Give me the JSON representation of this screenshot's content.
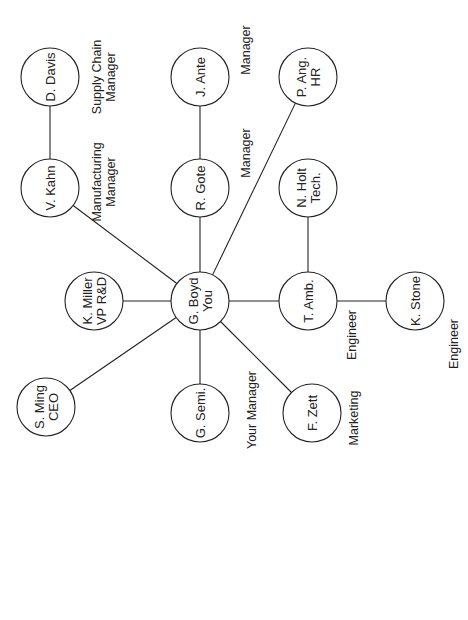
{
  "diagram": {
    "nodes": [
      {
        "id": "davis",
        "line1": "D. Davis",
        "line2": "",
        "cx": 50,
        "cy": 77
      },
      {
        "id": "kahn",
        "line1": "V. Kahn",
        "line2": "",
        "cx": 50,
        "cy": 188
      },
      {
        "id": "ante",
        "line1": "J. Ante",
        "line2": "",
        "cx": 200,
        "cy": 77
      },
      {
        "id": "gote",
        "line1": "R. Gote",
        "line2": "",
        "cx": 200,
        "cy": 188
      },
      {
        "id": "ang",
        "line1": "P. Ang.",
        "line2": "HR",
        "cx": 308,
        "cy": 77
      },
      {
        "id": "holt",
        "line1": "N. Holt",
        "line2": "Tech.",
        "cx": 308,
        "cy": 188
      },
      {
        "id": "miller",
        "line1": "K. Miller",
        "line2": "VP R&D",
        "cx": 94,
        "cy": 301
      },
      {
        "id": "boyd",
        "line1": "G. Boyd",
        "line2": "You",
        "cx": 200,
        "cy": 301
      },
      {
        "id": "amb",
        "line1": "T. Amb.",
        "line2": "",
        "cx": 308,
        "cy": 301
      },
      {
        "id": "stone",
        "line1": "K. Stone",
        "line2": "",
        "cx": 415,
        "cy": 301
      },
      {
        "id": "ming",
        "line1": "S. Ming",
        "line2": "CEO",
        "cx": 46,
        "cy": 407
      },
      {
        "id": "semi",
        "line1": "G. Semi.",
        "line2": "",
        "cx": 200,
        "cy": 413
      },
      {
        "id": "zett",
        "line1": "F. Zett",
        "line2": "",
        "cx": 312,
        "cy": 413
      }
    ],
    "edges": [
      {
        "from": "davis",
        "to": "kahn"
      },
      {
        "from": "kahn",
        "to": "boyd"
      },
      {
        "from": "ante",
        "to": "gote"
      },
      {
        "from": "gote",
        "to": "boyd"
      },
      {
        "from": "ang",
        "to": "boyd"
      },
      {
        "from": "holt",
        "to": "amb"
      },
      {
        "from": "miller",
        "to": "boyd"
      },
      {
        "from": "boyd",
        "to": "amb"
      },
      {
        "from": "amb",
        "to": "stone"
      },
      {
        "from": "ming",
        "to": "boyd"
      },
      {
        "from": "semi",
        "to": "boyd"
      },
      {
        "from": "zett",
        "to": "boyd"
      }
    ],
    "roles": [
      {
        "id": "role-davis",
        "line1": "Supply Chain",
        "line2": "Manager",
        "x": 103,
        "y": 77
      },
      {
        "id": "role-kahn",
        "line1": "Manufacturing",
        "line2": "Manager",
        "x": 103,
        "y": 182
      },
      {
        "id": "role-ante",
        "line1": "Manager",
        "line2": "",
        "x": 245,
        "y": 50
      },
      {
        "id": "role-gote",
        "line1": "Manager",
        "line2": "",
        "x": 245,
        "y": 153
      },
      {
        "id": "role-boyd",
        "line1": "Your Manager",
        "line2": "",
        "x": 251,
        "y": 410
      },
      {
        "id": "role-zett",
        "line1": "Marketing",
        "line2": "",
        "x": 353,
        "y": 418
      },
      {
        "id": "role-amb",
        "line1": "Engineer",
        "line2": "",
        "x": 351,
        "y": 335
      },
      {
        "id": "role-stone",
        "line1": "Engineer",
        "line2": "",
        "x": 453,
        "y": 344
      }
    ],
    "node_radius": 29,
    "text_rotation_deg": -90,
    "colors": {
      "stroke": "#222222",
      "background": "#ffffff",
      "text": "#222222"
    }
  }
}
